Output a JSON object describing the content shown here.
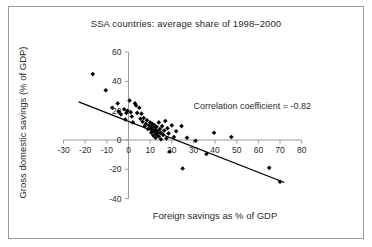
{
  "chart_data": {
    "type": "scatter",
    "title": "SSA countries: average share of 1998–2000",
    "xlabel": "Foreign savings as % of GDP",
    "ylabel": "Gross domestic savings (% of GDP)",
    "xlim": [
      -30,
      80
    ],
    "ylim": [
      -40,
      60
    ],
    "xticks": [
      -30,
      -20,
      -10,
      0,
      10,
      20,
      30,
      40,
      50,
      60,
      70,
      80
    ],
    "yticks": [
      -40,
      -20,
      0,
      20,
      40,
      60
    ],
    "xtick_labels": [
      "-30",
      "-20",
      "-10",
      "0",
      "10",
      "20",
      "30",
      "40",
      "50",
      "60",
      "70",
      "80"
    ],
    "ytick_labels": [
      "-40",
      "-20",
      "0",
      "20",
      "40",
      "60"
    ],
    "grid": false,
    "legend": false,
    "annotations": [
      {
        "text": "Correlation coefficient = -0.82",
        "x": 30,
        "y": 21
      }
    ],
    "marker": "diamond",
    "marker_color": "#000000",
    "series": [
      {
        "name": "SSA countries",
        "points": [
          [
            -16.5,
            45.0
          ],
          [
            -10.5,
            34.0
          ],
          [
            -7.5,
            22.0
          ],
          [
            -5.0,
            25.0
          ],
          [
            -4.5,
            19.5
          ],
          [
            -3.5,
            17.5
          ],
          [
            -2.0,
            21.0
          ],
          [
            -1.5,
            14.0
          ],
          [
            -1.0,
            18.5
          ],
          [
            -0.5,
            20.0
          ],
          [
            0.5,
            27.0
          ],
          [
            1.0,
            19.0
          ],
          [
            1.5,
            16.0
          ],
          [
            2.0,
            12.0
          ],
          [
            3.0,
            25.0
          ],
          [
            3.5,
            23.5
          ],
          [
            4.0,
            18.5
          ],
          [
            5.0,
            22.0
          ],
          [
            5.5,
            14.5
          ],
          [
            6.0,
            18.0
          ],
          [
            6.5,
            12.5
          ],
          [
            7.0,
            15.0
          ],
          [
            7.5,
            9.5
          ],
          [
            8.0,
            11.0
          ],
          [
            8.5,
            13.5
          ],
          [
            9.0,
            7.5
          ],
          [
            9.5,
            10.0
          ],
          [
            10.0,
            12.0
          ],
          [
            10.0,
            8.0
          ],
          [
            10.5,
            9.0
          ],
          [
            10.5,
            5.0
          ],
          [
            11.0,
            11.0
          ],
          [
            11.0,
            6.5
          ],
          [
            11.5,
            8.5
          ],
          [
            11.5,
            3.0
          ],
          [
            12.0,
            10.0
          ],
          [
            12.0,
            5.5
          ],
          [
            12.5,
            7.0
          ],
          [
            12.5,
            1.5
          ],
          [
            13.0,
            9.0
          ],
          [
            13.0,
            4.0
          ],
          [
            13.5,
            6.0
          ],
          [
            14.0,
            12.0
          ],
          [
            14.0,
            2.5
          ],
          [
            14.5,
            7.5
          ],
          [
            15.0,
            5.0
          ],
          [
            15.0,
            0.5
          ],
          [
            15.5,
            9.5
          ],
          [
            16.0,
            3.5
          ],
          [
            16.5,
            6.5
          ],
          [
            17.0,
            13.0
          ],
          [
            17.5,
            1.0
          ],
          [
            18.0,
            8.0
          ],
          [
            18.5,
            4.5
          ],
          [
            19.0,
            -8.0
          ],
          [
            20.0,
            10.0
          ],
          [
            21.0,
            2.0
          ],
          [
            22.0,
            6.0
          ],
          [
            24.5,
            9.5
          ],
          [
            25.0,
            -19.5
          ],
          [
            27.0,
            1.5
          ],
          [
            31.0,
            -0.5
          ],
          [
            36.0,
            -9.5
          ],
          [
            39.5,
            5.0
          ],
          [
            47.5,
            2.0
          ],
          [
            65.0,
            -19.0
          ],
          [
            70.0,
            -28.5
          ]
        ]
      }
    ],
    "trendline": {
      "label": "linear fit",
      "x_start": -23.0,
      "y_start": 26.0,
      "x_end": 72.0,
      "y_end": -29.0,
      "color": "#000000"
    }
  }
}
